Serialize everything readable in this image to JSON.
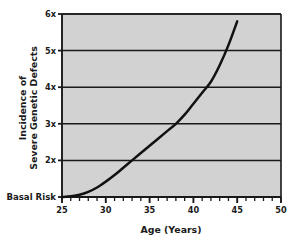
{
  "chart_data": {
    "type": "line",
    "title": "",
    "xlabel": "Age (Years)",
    "ylabel": "Incidence of Severe Genetic Defects",
    "ylabel_line1": "Incidence of",
    "ylabel_line2": "Severe Genetic Defects",
    "xlim": [
      25,
      50
    ],
    "ylim": [
      1,
      6
    ],
    "grid": true,
    "legend": "none",
    "plot_background_color": "#d2d2d2",
    "axis_color": "#1a1a1a",
    "line_color": "#111111",
    "page_background_color": "#ffffff",
    "x_tick_labels": [
      "25",
      "30",
      "35",
      "40",
      "45",
      "50"
    ],
    "x_tick_values": [
      25,
      30,
      35,
      40,
      45,
      50
    ],
    "x_minor_tick_interval": 1,
    "y_tick_labels": [
      "Basal Risk",
      "2x",
      "3x",
      "4x",
      "5x",
      "6x"
    ],
    "y_tick_values": [
      1,
      2,
      3,
      4,
      5,
      6
    ],
    "y_baseline_label": "Basal Risk",
    "series": [
      {
        "name": "Incidence of Severe Genetic Defects",
        "x": [
          25,
          26,
          27,
          28,
          29,
          30,
          31,
          32,
          33,
          34,
          35,
          36,
          37,
          38,
          39,
          40,
          41,
          42,
          43,
          44,
          45
        ],
        "values": [
          1.0,
          1.02,
          1.06,
          1.14,
          1.26,
          1.42,
          1.6,
          1.8,
          2.0,
          2.2,
          2.4,
          2.6,
          2.8,
          3.0,
          3.25,
          3.55,
          3.85,
          4.15,
          4.6,
          5.15,
          5.8
        ]
      }
    ],
    "annotations": []
  }
}
